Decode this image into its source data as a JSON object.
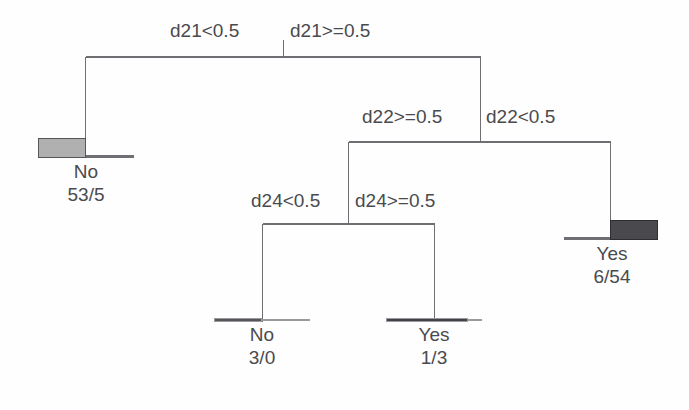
{
  "figure": {
    "type": "decision-tree-diagram",
    "background_color": "#fefefe",
    "line_color": "#6f6f73",
    "text_color": "#4a4a4e"
  },
  "splits": [
    {
      "id": "root",
      "variable": "d21",
      "left_label": "d21<0.5",
      "right_label": "d21>=0.5"
    },
    {
      "id": "node2",
      "variable": "d22",
      "left_label": "d22>=0.5",
      "right_label": "d22<0.5"
    },
    {
      "id": "node3",
      "variable": "d24",
      "left_label": "d24<0.5",
      "right_label": "d24>=0.5"
    }
  ],
  "leaves": [
    {
      "id": "leaf-no-53-5",
      "class_label": "No",
      "counts": "53/5",
      "bar_fill": "#b0b0b0",
      "bar_border": "#55555a",
      "bar_fraction": 0.5
    },
    {
      "id": "leaf-no-3-0",
      "class_label": "No",
      "counts": "3/0",
      "bar_fill": "#55555a",
      "bar_border": "#9a9a9e",
      "bar_fraction": 0.5
    },
    {
      "id": "leaf-yes-1-3",
      "class_label": "Yes",
      "counts": "1/3",
      "bar_fill": "#444448",
      "bar_border": "#9a9a9e",
      "bar_fraction": 0.85
    },
    {
      "id": "leaf-yes-6-54",
      "class_label": "Yes",
      "counts": "6/54",
      "bar_fill": "#4a4a4e",
      "bar_border": "#2e2e32",
      "bar_fraction": 0.5
    }
  ]
}
